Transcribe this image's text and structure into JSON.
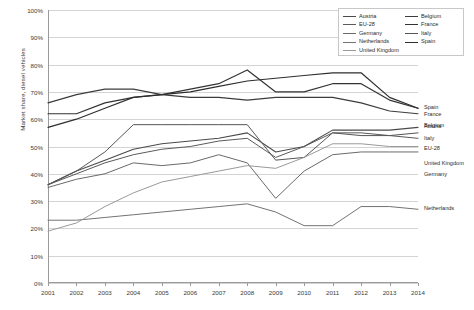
{
  "chart_data": {
    "type": "line",
    "title": "",
    "xlabel": "",
    "ylabel": "Market share, diesel vehicles",
    "x": [
      2001,
      2002,
      2003,
      2004,
      2005,
      2006,
      2007,
      2008,
      2009,
      2010,
      2011,
      2012,
      2013,
      2014
    ],
    "xlim": [
      2001,
      2014
    ],
    "ylim": [
      0,
      1.0
    ],
    "yticks": [
      "0%",
      "10%",
      "20%",
      "30%",
      "40%",
      "50%",
      "60%",
      "70%",
      "80%",
      "90%",
      "100%"
    ],
    "ytick_values": [
      0,
      10,
      20,
      30,
      40,
      50,
      60,
      70,
      80,
      90,
      100
    ],
    "xticks": [
      "2001",
      "2002",
      "2003",
      "2004",
      "2005",
      "2006",
      "2007",
      "2008",
      "2009",
      "2010",
      "2011",
      "2012",
      "2013",
      "2014"
    ],
    "grid": true,
    "legend_position": "top-right",
    "series": [
      {
        "name": "Austria",
        "color": "#4a4a4a",
        "width": 1.1,
        "values": [
          36,
          41,
          45,
          49,
          51,
          52,
          53,
          55,
          48,
          50,
          56,
          56,
          56,
          57
        ]
      },
      {
        "name": "Belgium",
        "color": "#3c3c3c",
        "width": 1.2,
        "values": [
          66,
          69,
          71,
          71,
          69,
          68,
          68,
          67,
          68,
          68,
          68,
          66,
          63,
          62
        ]
      },
      {
        "name": "EU-28",
        "color": "#5a5a5a",
        "width": 1.0,
        "values": [
          36,
          40,
          44,
          47,
          49,
          50,
          52,
          53,
          46,
          50,
          55,
          55,
          54,
          53
        ]
      },
      {
        "name": "France",
        "color": "#333333",
        "width": 1.2,
        "values": [
          62,
          62,
          66,
          68,
          69,
          71,
          73,
          78,
          70,
          70,
          73,
          73,
          67,
          64
        ]
      },
      {
        "name": "Germany",
        "color": "#6a6a6a",
        "width": 1.0,
        "values": [
          35,
          38,
          40,
          44,
          43,
          44,
          47,
          44,
          31,
          41,
          47,
          48,
          48,
          48
        ]
      },
      {
        "name": "Italy",
        "color": "#555555",
        "width": 1.0,
        "values": [
          36,
          41,
          48,
          58,
          58,
          58,
          58,
          58,
          45,
          46,
          55,
          54,
          54,
          55
        ]
      },
      {
        "name": "Netherlands",
        "color": "#737373",
        "width": 1.0,
        "values": [
          23,
          23,
          24,
          25,
          26,
          27,
          28,
          29,
          26,
          21,
          21,
          28,
          28,
          27
        ]
      },
      {
        "name": "Spain",
        "color": "#2e2e2e",
        "width": 1.2,
        "values": [
          57,
          60,
          64,
          68,
          69,
          70,
          72,
          74,
          75,
          76,
          77,
          77,
          68,
          64
        ]
      },
      {
        "name": "United Kingdom",
        "color": "#9a9a9a",
        "width": 1.0,
        "values": [
          19,
          22,
          28,
          33,
          37,
          39,
          41,
          43,
          42,
          46,
          51,
          51,
          50,
          50
        ]
      }
    ],
    "legend": {
      "column_left": [
        "Austria",
        "EU-28",
        "Germany",
        "Netherlands",
        "United Kingdom"
      ],
      "column_right": [
        "Belgium",
        "France",
        "Italy",
        "Spain"
      ]
    },
    "end_labels": [
      {
        "name": "Spain",
        "value": 64,
        "offset": 0
      },
      {
        "name": "France",
        "value": 64,
        "offset": 7
      },
      {
        "name": "Belgium",
        "value": 62,
        "offset": 12
      },
      {
        "name": "Austria",
        "value": 57,
        "offset": 0
      },
      {
        "name": "Italy",
        "value": 55,
        "offset": 6
      },
      {
        "name": "EU-28",
        "value": 53,
        "offset": 11
      },
      {
        "name": "United Kingdom",
        "value": 50,
        "offset": 17
      },
      {
        "name": "Germany",
        "value": 48,
        "offset": 23
      },
      {
        "name": "Netherlands",
        "value": 27,
        "offset": 0
      }
    ]
  }
}
